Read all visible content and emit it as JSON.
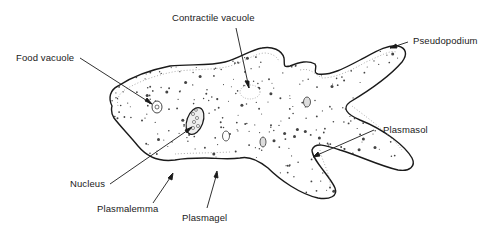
{
  "figure": {
    "colors": {
      "ink": "#1a1a1a",
      "background": "#ffffff",
      "stipple": "#555555"
    }
  },
  "labels": {
    "contractile_vacuole": "Contractile vacuole",
    "pseudopodium": "Pseudopodium",
    "food_vacuole": "Food vacuole",
    "plasmasol": "Plasmasol",
    "nucleus": "Nucleus",
    "plasmalemma": "Plasmalemma",
    "plasmagel": "Plasmagel"
  }
}
